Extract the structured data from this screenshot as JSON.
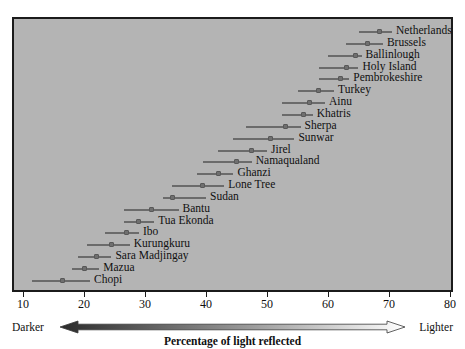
{
  "chart_data": {
    "type": "scatter",
    "title": "",
    "subtitle": "",
    "xlabel": "Percentage of light reflected",
    "ylabel": "",
    "xlim": [
      10,
      80
    ],
    "xticks": [
      10,
      20,
      30,
      40,
      50,
      60,
      70,
      80
    ],
    "xtick_labels": [
      "10",
      "20",
      "30",
      "40",
      "50",
      "60",
      "70",
      "80"
    ],
    "grid": false,
    "legend": null,
    "annotations": {
      "left_end": "Darker",
      "right_end": "Lighter",
      "axis_caption": "Percentage of light reflected"
    },
    "series_note": "Each row is a population: horizontal line spans the observed range, square marker is the mean percentage of light reflected.",
    "categories": [
      "Netherlands",
      "Brussels",
      "Ballinlough",
      "Holy Island",
      "Pembrokeshire",
      "Turkey",
      "Ainu",
      "Khatris",
      "Sherpa",
      "Sunwar",
      "Jirel",
      "Namaqualand",
      "Ghanzi",
      "Lone Tree",
      "Sudan",
      "Bantu",
      "Tua Ekonda",
      "Ibo",
      "Kurungkuru",
      "Sara Madjingay",
      "Mazua",
      "Chopi"
    ],
    "rows": [
      {
        "label": "Netherlands",
        "mean": 68.5,
        "low": 65.0,
        "high": 70.5
      },
      {
        "label": "Brussels",
        "mean": 66.5,
        "low": 63.0,
        "high": 69.0
      },
      {
        "label": "Ballinlough",
        "mean": 64.5,
        "low": 60.0,
        "high": 65.5
      },
      {
        "label": "Holy Island",
        "mean": 63.0,
        "low": 58.5,
        "high": 65.0
      },
      {
        "label": "Pembrokeshire",
        "mean": 62.0,
        "low": 58.5,
        "high": 63.5
      },
      {
        "label": "Turkey",
        "mean": 58.5,
        "low": 55.0,
        "high": 61.0
      },
      {
        "label": "Ainu",
        "mean": 57.0,
        "low": 52.5,
        "high": 59.5
      },
      {
        "label": "Khatris",
        "mean": 56.0,
        "low": 52.5,
        "high": 57.5
      },
      {
        "label": "Sherpa",
        "mean": 53.0,
        "low": 46.5,
        "high": 55.5
      },
      {
        "label": "Sunwar",
        "mean": 50.5,
        "low": 44.5,
        "high": 54.5
      },
      {
        "label": "Jirel",
        "mean": 47.5,
        "low": 42.0,
        "high": 50.0
      },
      {
        "label": "Namaqualand",
        "mean": 45.0,
        "low": 39.5,
        "high": 47.5
      },
      {
        "label": "Ghanzi",
        "mean": 42.0,
        "low": 38.5,
        "high": 44.5
      },
      {
        "label": "Lone Tree",
        "mean": 39.5,
        "low": 34.5,
        "high": 43.0
      },
      {
        "label": "Sudan",
        "mean": 34.5,
        "low": 33.0,
        "high": 40.0
      },
      {
        "label": "Bantu",
        "mean": 31.0,
        "low": 26.5,
        "high": 35.5
      },
      {
        "label": "Tua Ekonda",
        "mean": 29.0,
        "low": 26.5,
        "high": 31.5
      },
      {
        "label": "Ibo",
        "mean": 27.0,
        "low": 23.5,
        "high": 29.0
      },
      {
        "label": "Kurungkuru",
        "mean": 24.5,
        "low": 20.5,
        "high": 27.5
      },
      {
        "label": "Sara Madjingay",
        "mean": 22.0,
        "low": 19.0,
        "high": 24.5
      },
      {
        "label": "Mazua",
        "mean": 20.0,
        "low": 18.0,
        "high": 22.5
      },
      {
        "label": "Chopi",
        "mean": 16.5,
        "low": 11.5,
        "high": 21.0
      }
    ],
    "colors": {
      "plot_background": "#b4b4b4",
      "frame": "#1b1b1b",
      "line": "#6b6b6b",
      "marker": "#6f6f6f",
      "text": "#101010",
      "gradient_dark": "#2b2b2b",
      "gradient_light": "#ffffff"
    }
  }
}
